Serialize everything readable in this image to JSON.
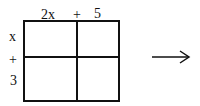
{
  "diagram": {
    "type": "area-model-grid",
    "top_labels": [
      "2x",
      "+",
      "5"
    ],
    "left_labels": [
      "x",
      "+",
      "3"
    ],
    "rows": 2,
    "cols": 2,
    "arrow": "right-arrow"
  }
}
